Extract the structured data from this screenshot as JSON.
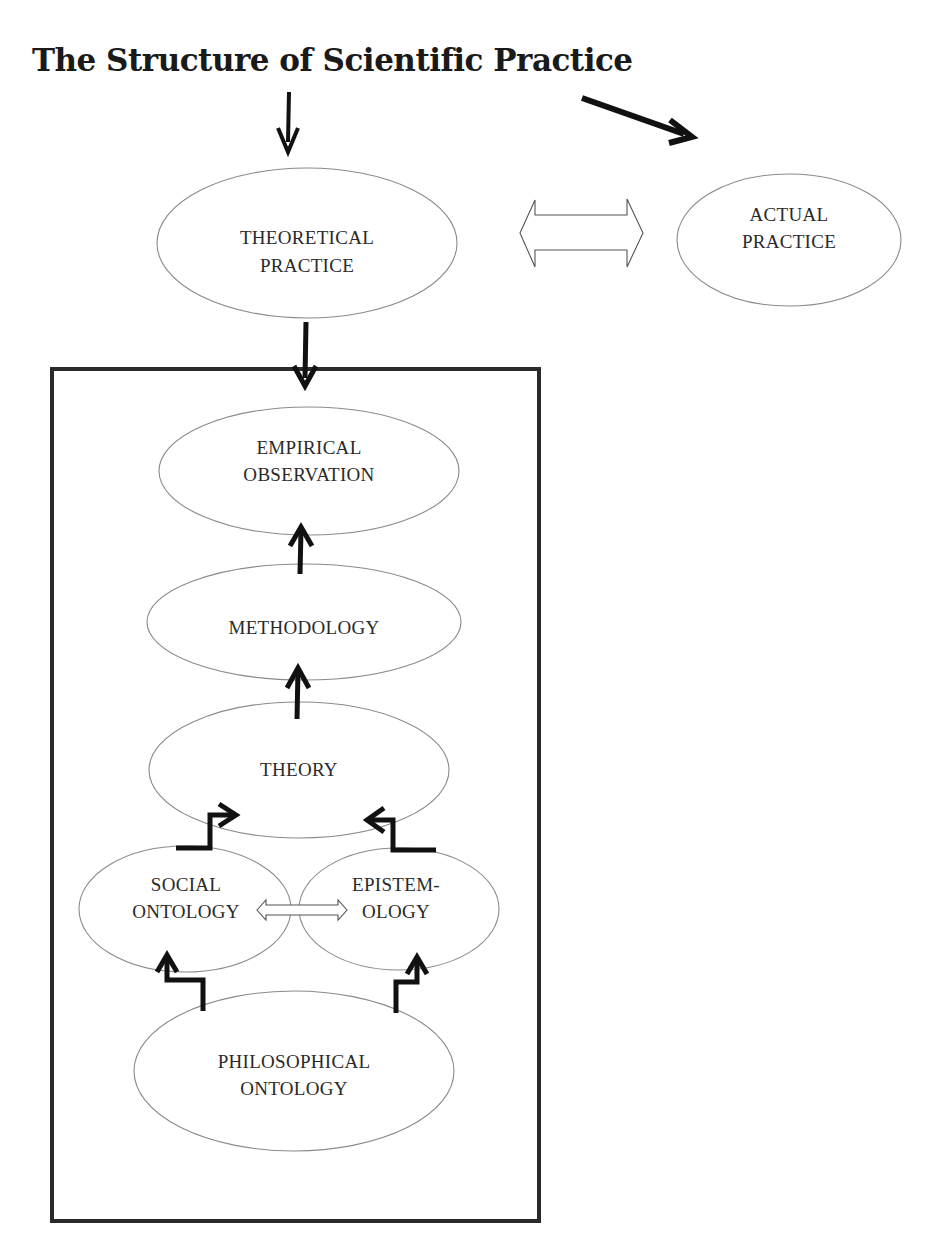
{
  "title": "The Structure of Scientific Practice",
  "nodes": {
    "theoretical_practice": {
      "line1": "THEORETICAL",
      "line2": "PRACTICE"
    },
    "actual_practice": {
      "line1": "ACTUAL",
      "line2": "PRACTICE"
    },
    "empirical_observation": {
      "line1": "EMPIRICAL",
      "line2": "OBSERVATION"
    },
    "methodology": {
      "line1": "METHODOLOGY"
    },
    "theory": {
      "line1": "THEORY"
    },
    "social_ontology": {
      "line1": "SOCIAL",
      "line2": "ONTOLOGY"
    },
    "epistemology": {
      "line1": "EPISTEM-",
      "line2": "OLOGY"
    },
    "philosophical_ontology": {
      "line1": "PHILOSOPHICAL",
      "line2": "ONTOLOGY"
    }
  },
  "edges": [
    {
      "from": "title",
      "to": "theoretical_practice",
      "style": "arrow-down"
    },
    {
      "from": "title",
      "to": "actual_practice",
      "style": "arrow-diagonal"
    },
    {
      "from": "theoretical_practice",
      "to": "actual_practice",
      "style": "hollow-double-arrow"
    },
    {
      "from": "theoretical_practice",
      "to": "inner_box",
      "style": "arrow-down"
    },
    {
      "from": "methodology",
      "to": "empirical_observation",
      "style": "arrow-up"
    },
    {
      "from": "theory",
      "to": "methodology",
      "style": "arrow-up"
    },
    {
      "from": "social_ontology",
      "to": "theory",
      "style": "step-arrow"
    },
    {
      "from": "epistemology",
      "to": "theory",
      "style": "step-arrow"
    },
    {
      "from": "social_ontology",
      "to": "epistemology",
      "style": "hollow-double-arrow"
    },
    {
      "from": "philosophical_ontology",
      "to": "social_ontology",
      "style": "step-arrow"
    },
    {
      "from": "philosophical_ontology",
      "to": "epistemology",
      "style": "step-arrow"
    }
  ],
  "colors": {
    "stroke": "#111111",
    "ellipse": "#8a8a8a",
    "text": "#2a2a2a"
  }
}
